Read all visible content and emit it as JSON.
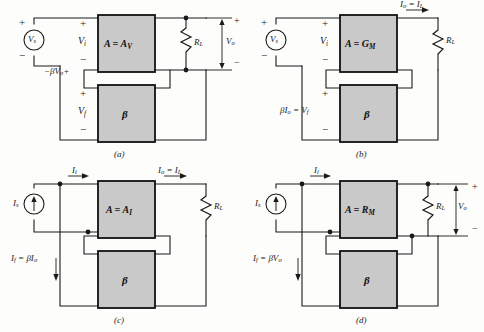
{
  "figure": {
    "block_fill": "#c9c9c9",
    "block_stroke": "#111111",
    "wire_color": "#1a1a1a",
    "background": "#fdfdfc"
  },
  "panels": [
    {
      "id": "a",
      "caption": "(a)",
      "topology": "series-shunt (voltage-series)",
      "source": {
        "kind": "voltage-source",
        "label": "V",
        "sub": "s",
        "plus": "+",
        "minus": "−"
      },
      "amplifier_block": {
        "label": "A = A",
        "sub": "V"
      },
      "feedback_block": {
        "label": "β"
      },
      "load": {
        "label": "R",
        "sub": "L"
      },
      "input_port": {
        "label": "V",
        "sub": "i",
        "plus": "+",
        "minus": "−"
      },
      "feedback_port": {
        "label": "V",
        "sub": "f",
        "plus": "+",
        "minus": "−"
      },
      "feedback_signal": {
        "text": "−βV",
        "sub": "o",
        "trailing": "+"
      },
      "output": {
        "label": "V",
        "sub": "o",
        "plus": "+",
        "minus": "−"
      },
      "output_current": null
    },
    {
      "id": "b",
      "caption": "(b)",
      "topology": "series-series (transconductance)",
      "source": {
        "kind": "voltage-source",
        "label": "V",
        "sub": "s",
        "plus": "+",
        "minus": "−"
      },
      "amplifier_block": {
        "label": "A = G",
        "sub": "M"
      },
      "feedback_block": {
        "label": "β"
      },
      "load": {
        "label": "R",
        "sub": "L"
      },
      "input_port": {
        "label": "V",
        "sub": "i",
        "plus": "+",
        "minus": "−"
      },
      "feedback_port": {
        "plus": "+",
        "minus": "−"
      },
      "feedback_signal": {
        "text": "βI",
        "sub": "o",
        "equals": " = V",
        "sub2": "f"
      },
      "output": null,
      "output_current": {
        "text": "I",
        "sub": "o",
        "equals": " = I",
        "sub2": "L"
      }
    },
    {
      "id": "c",
      "caption": "(c)",
      "topology": "shunt-series (current)",
      "source": {
        "kind": "current-source",
        "label": "I",
        "sub": "s"
      },
      "amplifier_block": {
        "label": "A = A",
        "sub": "I"
      },
      "feedback_block": {
        "label": "β"
      },
      "load": {
        "label": "R",
        "sub": "L"
      },
      "input_current": {
        "text": "I",
        "sub": "i"
      },
      "feedback_signal": {
        "text": "I",
        "sub": "f",
        "equals": " = βI",
        "sub2": "o"
      },
      "output": null,
      "output_current": {
        "text": "I",
        "sub": "o",
        "equals": " = I",
        "sub2": "L"
      }
    },
    {
      "id": "d",
      "caption": "(d)",
      "topology": "shunt-shunt (transresistance)",
      "source": {
        "kind": "current-source",
        "label": "I",
        "sub": "s"
      },
      "amplifier_block": {
        "label": "A = R",
        "sub": "M"
      },
      "feedback_block": {
        "label": "β"
      },
      "load": {
        "label": "R",
        "sub": "L"
      },
      "input_current": {
        "text": "I",
        "sub": "i"
      },
      "feedback_signal": {
        "text": "I",
        "sub": "f",
        "equals": " = βV",
        "sub2": "o"
      },
      "output": {
        "label": "V",
        "sub": "o",
        "plus": "+",
        "minus": "−"
      },
      "output_current": null
    }
  ]
}
